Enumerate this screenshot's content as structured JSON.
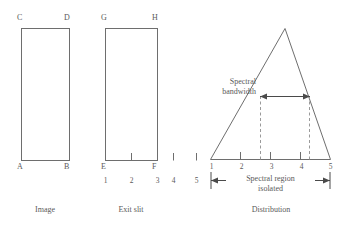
{
  "figure": {
    "stroke_color": "#6e6e6e",
    "text_color": "#5a5a5a",
    "background": "#ffffff"
  },
  "panels": {
    "image": {
      "caption": "Image",
      "corners": {
        "top_left": "C",
        "top_right": "D",
        "bottom_left": "A",
        "bottom_right": "B"
      }
    },
    "exit_slit": {
      "caption": "Exit slit",
      "corners": {
        "top_left": "G",
        "top_right": "H",
        "bottom_left": "E",
        "bottom_right": "F"
      },
      "scale_numbers": [
        "1",
        "2",
        "3",
        "4",
        "5"
      ]
    },
    "distribution": {
      "caption": "Distribution",
      "scale_numbers": [
        "1",
        "2",
        "3",
        "4",
        "5"
      ],
      "bandwidth_label_line1": "Spectral",
      "bandwidth_label_line2": "bandwidth",
      "region_label_line1": "Spectral region",
      "region_label_line2": "isolated"
    }
  }
}
